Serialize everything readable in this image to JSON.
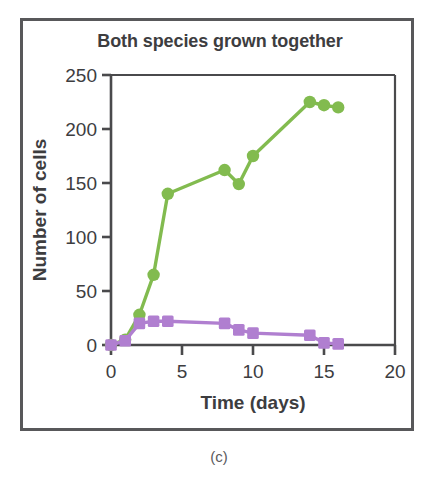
{
  "figure": {
    "caption": "(c)"
  },
  "chart_data": {
    "type": "line",
    "title": "Both species grown together",
    "xlabel": "Time (days)",
    "ylabel": "Number of cells",
    "xlim": [
      0,
      20
    ],
    "ylim": [
      0,
      250
    ],
    "xticks": [
      "0",
      "5",
      "10",
      "15",
      "20"
    ],
    "xtick_values": [
      0,
      5,
      10,
      15,
      20
    ],
    "yticks": [
      "0",
      "50",
      "100",
      "150",
      "200",
      "250"
    ],
    "ytick_values": [
      0,
      50,
      100,
      150,
      200,
      250
    ],
    "grid": false,
    "legend": "none",
    "series": [
      {
        "name": "green-species",
        "color": "#82bb4f",
        "marker": "circle",
        "x": [
          0,
          1,
          2,
          3,
          4,
          8,
          9,
          10,
          14,
          15,
          16
        ],
        "values": [
          0,
          5,
          28,
          65,
          140,
          162,
          149,
          175,
          225,
          222,
          220
        ]
      },
      {
        "name": "purple-species",
        "color": "#b07fd0",
        "marker": "square",
        "x": [
          0,
          1,
          2,
          3,
          4,
          8,
          9,
          10,
          14,
          15,
          16
        ],
        "values": [
          0,
          4,
          20,
          22,
          22,
          20,
          14,
          11,
          9,
          2,
          1
        ]
      }
    ]
  }
}
